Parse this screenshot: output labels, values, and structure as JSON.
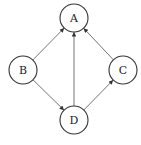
{
  "diagram": {
    "type": "directed-graph",
    "nodes": [
      {
        "id": "A",
        "label": "A",
        "cx": 74,
        "cy": 18
      },
      {
        "id": "B",
        "label": "B",
        "cx": 23,
        "cy": 70
      },
      {
        "id": "C",
        "label": "C",
        "cx": 123,
        "cy": 70
      },
      {
        "id": "D",
        "label": "D",
        "cx": 74,
        "cy": 120
      }
    ],
    "edges": [
      {
        "from": "B",
        "to": "A"
      },
      {
        "from": "D",
        "to": "A"
      },
      {
        "from": "C",
        "to": "A"
      },
      {
        "from": "B",
        "to": "D"
      },
      {
        "from": "D",
        "to": "C"
      }
    ],
    "node_radius": 14,
    "colors": {
      "stroke": "#333333",
      "edge": "#666666",
      "background": "#ffffff"
    }
  }
}
